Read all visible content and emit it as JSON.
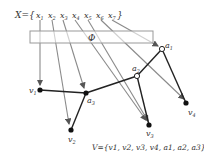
{
  "diagram": {
    "input_set": {
      "label": "X={",
      "close": "}",
      "items": [
        "x",
        "x",
        "x",
        "x",
        "x",
        "x",
        "x"
      ],
      "subscripts": [
        "1",
        "2",
        "3",
        "4",
        "5",
        "6",
        "7"
      ]
    },
    "mapping_box": {
      "label": "Φ"
    },
    "nodes": {
      "a1": {
        "name": "a",
        "sub": "1"
      },
      "a2": {
        "name": "a",
        "sub": "2"
      },
      "a3": {
        "name": "a",
        "sub": "3"
      },
      "v1": {
        "name": "v",
        "sub": "1"
      },
      "v2": {
        "name": "v",
        "sub": "2"
      },
      "v3": {
        "name": "v",
        "sub": "3"
      },
      "v4": {
        "name": "v",
        "sub": "4"
      }
    },
    "output_set": {
      "label": "V={v1, v2, v3, v4, a1, a2, a3}"
    },
    "colors": {
      "arrow": "#888888",
      "edge": "#222222",
      "node": "#111111",
      "box": "#999999"
    }
  }
}
